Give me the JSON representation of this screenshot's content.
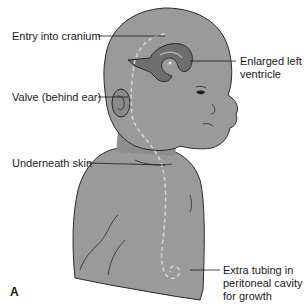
{
  "figure": {
    "panel_letter": "A",
    "colors": {
      "skin": "#9a9a9a",
      "skin_dark": "#7a7a7a",
      "outline": "#2a2a2a",
      "ventricle": "#6e6e6e",
      "ventricle_light": "#b5b5b5",
      "shunt_tubing": "#d8d8d8",
      "leader_line": "#1a1a1a",
      "background": "#ffffff"
    },
    "labels": {
      "entry": "Entry into cranium",
      "ventricle_line1": "Enlarged left",
      "ventricle_line2": "ventricle",
      "valve": "Valve (behind ear)",
      "skin": "Underneath skin",
      "extra_line1": "Extra tubing in",
      "extra_line2": "peritoneal cavity",
      "extra_line3": "for growth"
    }
  }
}
